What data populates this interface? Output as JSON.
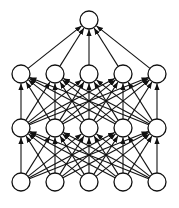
{
  "diagram": {
    "type": "neural-network",
    "colors": {
      "stroke": "#111111",
      "fill": "#ffffff",
      "background": "#ffffff"
    },
    "node_radius": 9,
    "layers": [
      {
        "name": "input",
        "y": 182,
        "x": [
          21,
          55,
          89,
          123,
          157
        ]
      },
      {
        "name": "hidden-1",
        "y": 128,
        "x": [
          21,
          55,
          89,
          123,
          157
        ]
      },
      {
        "name": "hidden-2",
        "y": 74,
        "x": [
          21,
          55,
          89,
          123,
          157
        ]
      },
      {
        "name": "output",
        "y": 20,
        "x": [
          89
        ]
      }
    ],
    "connectivity": "fully-connected",
    "edge_direction": "upward"
  }
}
